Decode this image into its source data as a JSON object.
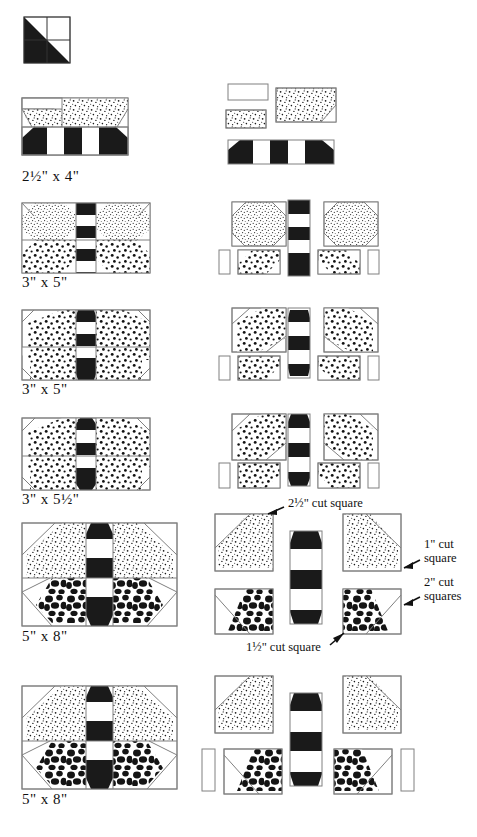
{
  "document": {
    "title": "Butterfly / Bee Quilt Block Piecing Diagram",
    "kind": "quilting pattern construction diagram"
  },
  "palette": {
    "outline": "#808080",
    "dark_fabric": "#1a1a1a",
    "light_fabric": "#ffffff",
    "fine_dot_fabric": "#ffffff",
    "medium_dot_fabric": "#ffffff",
    "pebble_fabric": "#ffffff",
    "text": "#111111"
  },
  "legend": {
    "fabrics": [
      "solid dark (black)",
      "solid light (white)",
      "fine speckled print",
      "medium dotted print",
      "large pebble print"
    ]
  },
  "rows": [
    {
      "id": "row-key-block",
      "size_label": "",
      "note": "four-patch key block with half-square diagonal",
      "has_label": false
    },
    {
      "id": "row-1",
      "size_label": "2½\"  x  4\"",
      "pieces_note": "two light rectangles, one fine-dot rectangle, one striped body strip"
    },
    {
      "id": "row-2",
      "size_label": "3\"  x  5\"",
      "pieces_note": "two fine-dot wing squares, one striped body, two medium-dot rectangles, two small light rectangles"
    },
    {
      "id": "row-3",
      "size_label": "3\"  x  5\"",
      "pieces_note": "two medium-dot wing squares, one striped body, two medium-dot rectangles, two small light rectangles"
    },
    {
      "id": "row-4",
      "size_label": "3\"  x  5½\"",
      "pieces_note": "two medium-dot wing squares, one longer striped body, two medium-dot rectangles, two small light rectangles"
    },
    {
      "id": "row-5",
      "size_label": "5\"  x  8\"",
      "pieces_note": "two fine-dot upper wing squares, two pebble lower wing squares, one striped body"
    },
    {
      "id": "row-6",
      "size_label": "5\"  x  8\"",
      "pieces_note": "two fine-dot upper wing squares, two pebble lower wing squares, one striped body, two light rectangles"
    }
  ],
  "annotations": [
    {
      "id": "annot-top",
      "text": "2½\" cut square"
    },
    {
      "id": "annot-right-1",
      "line1": "1\" cut",
      "line2": "square"
    },
    {
      "id": "annot-right-2",
      "line1": "2\" cut",
      "line2": "squares"
    },
    {
      "id": "annot-bottom",
      "text": "1½\" cut square"
    }
  ]
}
